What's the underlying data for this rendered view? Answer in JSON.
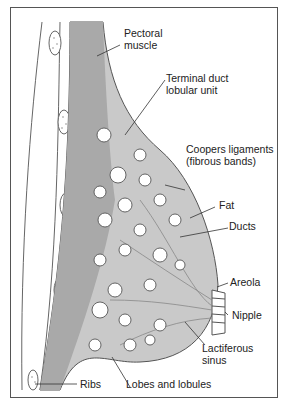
{
  "diagram": {
    "type": "anatomical illustration",
    "labels": {
      "pectoral_muscle": [
        "Pectoral",
        "muscle"
      ],
      "terminal_duct": [
        "Terminal duct",
        "lobular unit"
      ],
      "coopers": [
        "Coopers ligaments",
        "(fibrous bands)"
      ],
      "fat": "Fat",
      "ducts": "Ducts",
      "areola": "Areola",
      "nipple": "Nipple",
      "lactiferous": [
        "Lactiferous",
        "sinus"
      ],
      "ribs": "Ribs",
      "lobes": "Lobes and lobules"
    },
    "colors": {
      "tissue_fill": "#c9c9c9",
      "muscle_fill": "#a9a9a9",
      "outline": "#555555",
      "lobule_fill": "#ffffff",
      "text": "#222222"
    }
  }
}
